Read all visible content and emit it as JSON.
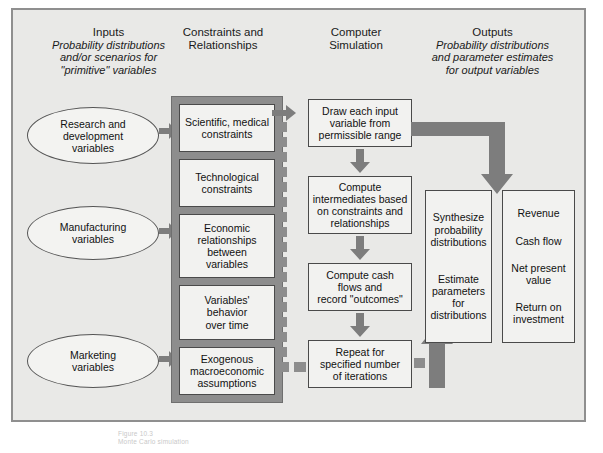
{
  "figure": {
    "caption_line1": "Figure 10.3",
    "caption_line2": "Monte Carlo simulation"
  },
  "columns": [
    {
      "id": "inputs",
      "title": "Inputs",
      "subtitle_lines": [
        "Probability distributions",
        "and/or scenarios for",
        "\"primitive\" variables"
      ]
    },
    {
      "id": "constraints",
      "title_lines": [
        "Constraints and",
        "Relationships"
      ],
      "subtitle_lines": []
    },
    {
      "id": "simulation",
      "title_lines": [
        "Computer",
        "Simulation"
      ],
      "subtitle_lines": []
    },
    {
      "id": "outputs",
      "title": "Outputs",
      "subtitle_lines": [
        "Probability distributions",
        "and parameter estimates",
        "for output variables"
      ]
    }
  ],
  "inputs": {
    "nodes": [
      {
        "id": "rnd",
        "lines": [
          "Research and",
          "development",
          "variables"
        ]
      },
      {
        "id": "manufacturing",
        "lines": [
          "Manufacturing",
          "variables"
        ]
      },
      {
        "id": "marketing",
        "lines": [
          "Marketing",
          "variables"
        ]
      }
    ]
  },
  "constraints": {
    "boxes": [
      {
        "id": "scientific",
        "lines": [
          "Scientific, medical",
          "constraints"
        ]
      },
      {
        "id": "technological",
        "lines": [
          "Technological",
          "constraints"
        ]
      },
      {
        "id": "economic",
        "lines": [
          "Economic",
          "relationships",
          "between",
          "variables"
        ]
      },
      {
        "id": "behavior",
        "lines": [
          "Variables'",
          "behavior",
          "over time"
        ]
      },
      {
        "id": "exogenous",
        "lines": [
          "Exogenous",
          "macroeconomic",
          "assumptions"
        ]
      }
    ]
  },
  "simulation": {
    "steps": [
      {
        "id": "draw",
        "lines": [
          "Draw each input",
          "variable from",
          "permissible range"
        ]
      },
      {
        "id": "compute-intermediates",
        "lines": [
          "Compute",
          "intermediates based",
          "on constraints and",
          "relationships"
        ]
      },
      {
        "id": "compute-cash",
        "lines": [
          "Compute cash",
          "flows and",
          "record \"outcomes\""
        ]
      },
      {
        "id": "repeat",
        "lines": [
          "Repeat for",
          "specified number",
          "of iterations"
        ]
      }
    ]
  },
  "synthesis": {
    "groups": [
      {
        "id": "synthesize",
        "lines": [
          "Synthesize",
          "probability",
          "distributions"
        ]
      },
      {
        "id": "estimate",
        "lines": [
          "Estimate",
          "parameters",
          "for",
          "distributions"
        ]
      }
    ]
  },
  "outputs": {
    "items": [
      {
        "id": "revenue",
        "lines": [
          "Revenue"
        ]
      },
      {
        "id": "cash-flow",
        "lines": [
          "Cash flow"
        ]
      },
      {
        "id": "npv",
        "lines": [
          "Net present",
          "value"
        ]
      },
      {
        "id": "roi",
        "lines": [
          "Return on",
          "investment"
        ]
      }
    ]
  },
  "colors": {
    "panel_bg": "#e9e9e7",
    "panel_border": "#8f8f8f",
    "grey_container": "#8d8d8d",
    "arrow": "#7d7d7d",
    "box_bg": "#f2f2f0",
    "box_border": "#4a4a4a",
    "text": "#111111"
  }
}
